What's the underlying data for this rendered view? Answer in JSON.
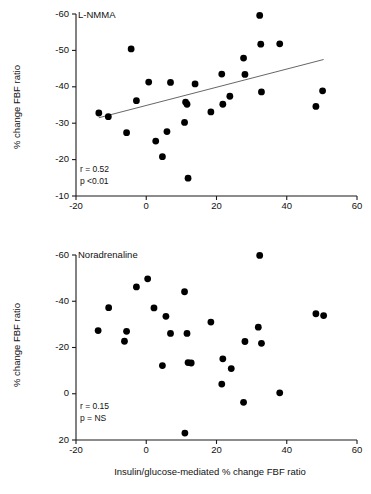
{
  "figure": {
    "xlabel": "Insulin/glucose-mediated % change FBF ratio",
    "ylabel": "% change FBF ratio"
  },
  "chart_data": [
    {
      "type": "scatter",
      "panel_id": "top",
      "title": "L-NMMA",
      "xlabel": "",
      "ylabel": "% change FBF ratio",
      "xlim": [
        -20,
        60
      ],
      "ylim": [
        -10,
        -60
      ],
      "y_inverted": true,
      "xticks": [
        -20,
        0,
        20,
        40,
        60
      ],
      "yticks": [
        -60,
        -50,
        -40,
        -30,
        -20,
        -10
      ],
      "grid": false,
      "legend": "none",
      "annotations": {
        "r": "r = 0.52",
        "p": "p <0.01"
      },
      "r_value": 0.52,
      "p_value": "<0.01",
      "trendline": {
        "show": true,
        "x": [
          -13.5,
          50.5
        ],
        "y": [
          -31.5,
          -47.5
        ]
      },
      "points": [
        {
          "x": -13.5,
          "y": -32.8
        },
        {
          "x": -10.8,
          "y": -31.8
        },
        {
          "x": -5.6,
          "y": -27.4
        },
        {
          "x": -4.3,
          "y": -50.4
        },
        {
          "x": -2.8,
          "y": -36.2
        },
        {
          "x": 0.7,
          "y": -41.3
        },
        {
          "x": 2.7,
          "y": -25.1
        },
        {
          "x": 4.6,
          "y": -20.8
        },
        {
          "x": 5.9,
          "y": -27.7
        },
        {
          "x": 6.9,
          "y": -41.2
        },
        {
          "x": 10.9,
          "y": -30.2
        },
        {
          "x": 11.2,
          "y": -35.8
        },
        {
          "x": 11.6,
          "y": -35.2
        },
        {
          "x": 11.9,
          "y": -14.9
        },
        {
          "x": 13.9,
          "y": -40.8
        },
        {
          "x": 18.4,
          "y": -33.1
        },
        {
          "x": 21.5,
          "y": -43.5
        },
        {
          "x": 21.8,
          "y": -35.2
        },
        {
          "x": 23.8,
          "y": -37.4
        },
        {
          "x": 27.7,
          "y": -47.9
        },
        {
          "x": 28.1,
          "y": -43.4
        },
        {
          "x": 32.3,
          "y": -59.6
        },
        {
          "x": 32.6,
          "y": -51.7
        },
        {
          "x": 32.8,
          "y": -38.6
        },
        {
          "x": 38.0,
          "y": -51.8
        },
        {
          "x": 48.3,
          "y": -34.6
        },
        {
          "x": 50.2,
          "y": -38.9
        }
      ]
    },
    {
      "type": "scatter",
      "panel_id": "bottom",
      "title": "Noradrenaline",
      "xlabel": "Insulin/glucose-mediated % change FBF ratio",
      "ylabel": "% change FBF ratio",
      "xlim": [
        -20,
        60
      ],
      "ylim": [
        20,
        -60
      ],
      "y_inverted": true,
      "xticks": [
        -20,
        0,
        20,
        40,
        60
      ],
      "yticks": [
        -60,
        -40,
        -20,
        0,
        20
      ],
      "grid": false,
      "legend": "none",
      "annotations": {
        "r": "r = 0.15",
        "p": "p = NS"
      },
      "r_value": 0.15,
      "p_value": "NS",
      "trendline": {
        "show": false
      },
      "points": [
        {
          "x": -13.7,
          "y": -27.3
        },
        {
          "x": -10.7,
          "y": -37.2
        },
        {
          "x": -6.2,
          "y": -22.7
        },
        {
          "x": -5.6,
          "y": -27.0
        },
        {
          "x": -2.8,
          "y": -46.2
        },
        {
          "x": 0.4,
          "y": -49.7
        },
        {
          "x": 2.2,
          "y": -37.1
        },
        {
          "x": 4.6,
          "y": -12.2
        },
        {
          "x": 5.6,
          "y": -33.5
        },
        {
          "x": 6.9,
          "y": -26.1
        },
        {
          "x": 10.9,
          "y": -44.1
        },
        {
          "x": 11.0,
          "y": 17.0
        },
        {
          "x": 11.6,
          "y": -26.1
        },
        {
          "x": 11.9,
          "y": -13.5
        },
        {
          "x": 12.8,
          "y": -13.3
        },
        {
          "x": 18.4,
          "y": -31.0
        },
        {
          "x": 21.5,
          "y": -4.2
        },
        {
          "x": 21.8,
          "y": -15.1
        },
        {
          "x": 24.2,
          "y": -10.9
        },
        {
          "x": 27.7,
          "y": 3.7
        },
        {
          "x": 28.1,
          "y": -22.6
        },
        {
          "x": 31.9,
          "y": -28.8
        },
        {
          "x": 32.3,
          "y": -59.8
        },
        {
          "x": 32.8,
          "y": -21.8
        },
        {
          "x": 38.0,
          "y": -0.4
        },
        {
          "x": 48.3,
          "y": -34.6
        },
        {
          "x": 50.5,
          "y": -33.8
        }
      ]
    }
  ]
}
